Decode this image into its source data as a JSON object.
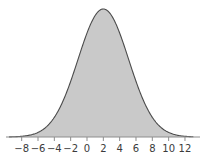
{
  "chart_data": {
    "type": "area",
    "title": "",
    "subtitle": "",
    "xlabel": "",
    "ylabel": "",
    "distribution": "normal",
    "mean": 2,
    "sigma": 3.1,
    "xlim": [
      -9.5,
      13.0
    ],
    "ylim": [
      0,
      1.05
    ],
    "grid": false,
    "legend": null,
    "x_ticks": [
      -8,
      -6,
      -4,
      -2,
      0,
      2,
      4,
      6,
      8,
      10,
      12
    ],
    "x_tick_labels": [
      "−8",
      "−6",
      "−4",
      "−2",
      "0",
      "2",
      "4",
      "6",
      "8",
      "10",
      "12"
    ],
    "y_ticks": [],
    "y_tick_labels": [],
    "x": [
      -9.5,
      -9,
      -8.5,
      -8,
      -7.5,
      -7,
      -6.5,
      -6,
      -5.5,
      -5,
      -4.5,
      -4,
      -3.5,
      -3,
      -2.5,
      -2,
      -1.5,
      -1,
      -0.5,
      0,
      0.5,
      1,
      1.5,
      2,
      2.5,
      3,
      3.5,
      4,
      4.5,
      5,
      5.5,
      6,
      6.5,
      7,
      7.5,
      8,
      8.5,
      9,
      9.5,
      10,
      10.5,
      11,
      11.5,
      12,
      12.5,
      13
    ],
    "y": [
      0.002,
      0.003,
      0.005,
      0.008,
      0.012,
      0.018,
      0.026,
      0.037,
      0.052,
      0.071,
      0.095,
      0.125,
      0.161,
      0.204,
      0.253,
      0.307,
      0.366,
      0.427,
      0.489,
      0.55,
      0.61,
      0.666,
      0.718,
      0.764,
      0.804,
      0.836,
      0.861,
      0.878,
      0.887,
      0.888,
      0.882,
      0.868,
      0.847,
      0.82,
      0.787,
      0.749,
      0.707,
      0.661,
      0.613,
      0.563,
      0.512,
      0.461,
      0.41,
      0.361,
      0.313,
      0.268
    ],
    "peak_value": 1.0,
    "peak_x": 2,
    "colors": {
      "fill": "#c9c9c9",
      "stroke": "#4a4a4a",
      "axis": "#8d8d8d",
      "tick": "#8d8d8d",
      "label": "#3b3b3b",
      "background": "#ffffff"
    }
  },
  "axis": {
    "name": "x-axis",
    "baseline_y": 137,
    "tick_length": 4
  }
}
